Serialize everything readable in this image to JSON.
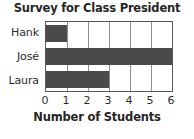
{
  "chart_data": {
    "type": "bar",
    "orientation": "horizontal",
    "title": "Survey for Class President",
    "xlabel": "Number of Students",
    "ylabel": "",
    "categories": [
      "Hank",
      "José",
      "Laura"
    ],
    "values": [
      1,
      6,
      3
    ],
    "xlim": [
      0,
      6
    ],
    "xticks": [
      0,
      1,
      2,
      3,
      4,
      5,
      6
    ],
    "xtick_labels": [
      "0",
      "1",
      "2",
      "3",
      "4",
      "5",
      "6"
    ],
    "grid": true,
    "grid_axis": "x",
    "legend": false,
    "legend_position": "none",
    "colors": {
      "bar_fill": "#4a4a4a",
      "plot_background": "#ffffff",
      "gridline": "#8e8e8e",
      "axis_border": "#585858",
      "text": "#2b2b2b",
      "title_text": "#262626"
    }
  }
}
